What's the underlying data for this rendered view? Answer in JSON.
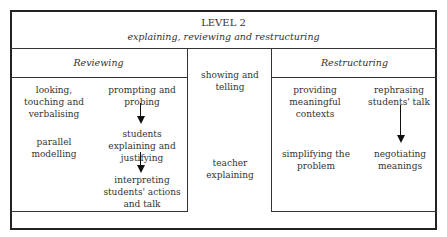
{
  "header": {
    "title": "LEVEL 2",
    "subtitle": "explaining, reviewing and restructuring"
  },
  "reviewing": {
    "heading": "Reviewing",
    "items": {
      "looking": "looking, touching and verbalising",
      "prompting": "prompting and probing",
      "parallel": "parallel modelling",
      "students_explaining": "students explaining and justifying",
      "interpreting": "interpreting students' actions and talk"
    }
  },
  "middle": {
    "showing": "showing and telling",
    "teacher": "teacher explaining"
  },
  "restructuring": {
    "heading": "Restructuring",
    "items": {
      "providing": "providing meaningful contexts",
      "rephrasing": "rephrasing students' talk",
      "simplifying": "simplifying the problem",
      "negotiating": "negotiating meanings"
    }
  },
  "arrows": [
    {
      "from": "prompting and probing",
      "to": "students explaining and justifying"
    },
    {
      "from": "students explaining and justifying",
      "to": "interpreting students' actions and talk"
    },
    {
      "from": "rephrasing students' talk",
      "to": "negotiating meanings"
    }
  ]
}
